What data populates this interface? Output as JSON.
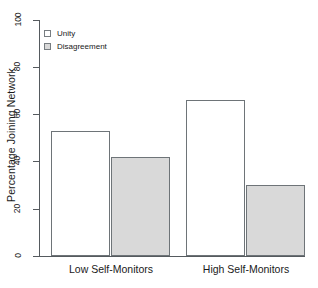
{
  "chart_data": {
    "type": "bar",
    "title": "",
    "subtitle": "",
    "xlabel": "",
    "ylabel": "Percentage Joining Network",
    "ylim": [
      0,
      100
    ],
    "yticks": [
      0,
      20,
      40,
      60,
      80,
      100
    ],
    "ytick_labels": [
      "0",
      "20",
      "40",
      "60",
      "80",
      "100"
    ],
    "grid": false,
    "legend_position": "top-left",
    "categories": [
      "Low Self-Monitors",
      "High Self-Monitors"
    ],
    "series": [
      {
        "name": "Unity",
        "color": "#ffffff",
        "border_color": "#6e7478",
        "values": [
          53,
          66
        ]
      },
      {
        "name": "Disagreement",
        "color": "#d9d9d9",
        "border_color": "#6e7478",
        "values": [
          42,
          30
        ]
      }
    ]
  },
  "legend": {
    "items": [
      {
        "label": "Unity",
        "swatch": "unity"
      },
      {
        "label": "Disagreement",
        "swatch": "disagreement"
      }
    ]
  },
  "axes": {
    "y_title": "Percentage Joining Network",
    "y_tick_labels": [
      "100",
      "80",
      "60",
      "40",
      "20",
      "0"
    ],
    "x_group_labels": [
      "Low Self-Monitors",
      "High Self-Monitors"
    ]
  },
  "colors": {
    "axis": "#555a5e",
    "bar_border": "#6e7478",
    "unity_fill": "#ffffff",
    "disagreement_fill": "#d9d9d9",
    "text": "#1a1a1a",
    "background": "#ffffff"
  }
}
